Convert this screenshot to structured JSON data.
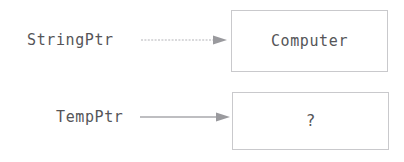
{
  "diagram": {
    "type": "pointer-memory-diagram",
    "background_color": "#ffffff",
    "text_color": "#555558",
    "border_color": "#c9c9cc",
    "arrow_color": "#9a9a9e",
    "rows": [
      {
        "id": "string-row",
        "pointer_label": "StringPtr",
        "arrow_icon": "arrow-right-icon",
        "box_value": "Computer"
      },
      {
        "id": "temp-row",
        "pointer_label": "TempPtr",
        "arrow_icon": "arrow-right-icon",
        "box_value": "?"
      }
    ]
  }
}
